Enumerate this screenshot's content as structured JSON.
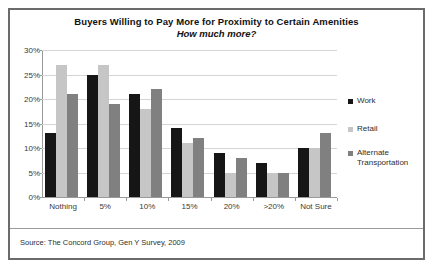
{
  "chart_data": {
    "type": "bar",
    "title": "Buyers Willing to Pay More for Proximity to Certain Amenities",
    "subtitle": "How much more?",
    "xlabel": "",
    "ylabel": "",
    "ylim": [
      0,
      30
    ],
    "ytick_labels": [
      "0%",
      "5%",
      "10%",
      "15%",
      "20%",
      "25%",
      "30%"
    ],
    "ytick_values": [
      0,
      5,
      10,
      15,
      20,
      25,
      30
    ],
    "grid": true,
    "legend_position": "right",
    "categories": [
      "Nothing",
      "5%",
      "10%",
      "15%",
      "20%",
      ">20%",
      "Not Sure"
    ],
    "series": [
      {
        "name": "Work",
        "color": "#161616",
        "values": [
          13,
          25,
          21,
          14,
          9,
          7,
          10
        ]
      },
      {
        "name": "Retail",
        "color": "#c6c6c6",
        "values": [
          27,
          27,
          18,
          11,
          5,
          5,
          10
        ]
      },
      {
        "name": "Alternate Transportation",
        "color": "#808080",
        "values": [
          21,
          19,
          22,
          12,
          8,
          5,
          13
        ]
      }
    ],
    "source": "Source: The Concord Group, Gen Y Survey, 2009"
  }
}
